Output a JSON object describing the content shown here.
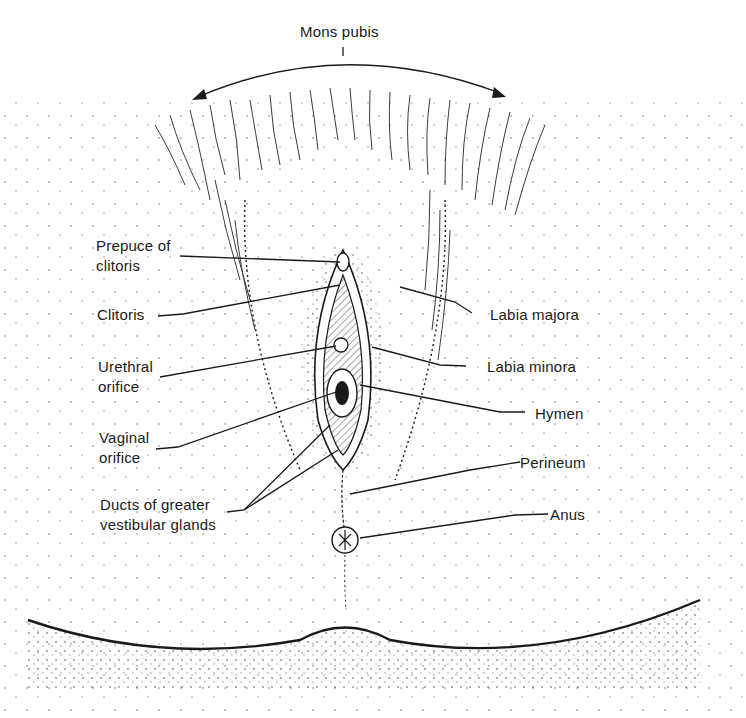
{
  "figure": {
    "type": "anatomical-illustration",
    "ink_color": "#1a1a1a",
    "background": "#ffffff"
  },
  "labels": {
    "top": {
      "text": "Mons pubis"
    },
    "left": [
      {
        "id": "prepuce",
        "text": "Prepuce of\nclitoris"
      },
      {
        "id": "clitoris",
        "text": "Clitoris"
      },
      {
        "id": "urethral",
        "text": "Urethral\norifice"
      },
      {
        "id": "vaginal",
        "text": "Vaginal\norifice"
      },
      {
        "id": "ducts",
        "text": "Ducts of greater\nvestibular glands"
      }
    ],
    "right": [
      {
        "id": "labia-majora",
        "text": "Labia majora"
      },
      {
        "id": "labia-minora",
        "text": "Labia minora"
      },
      {
        "id": "hymen",
        "text": "Hymen"
      },
      {
        "id": "perineum",
        "text": "Perineum"
      },
      {
        "id": "anus",
        "text": "Anus"
      }
    ]
  }
}
